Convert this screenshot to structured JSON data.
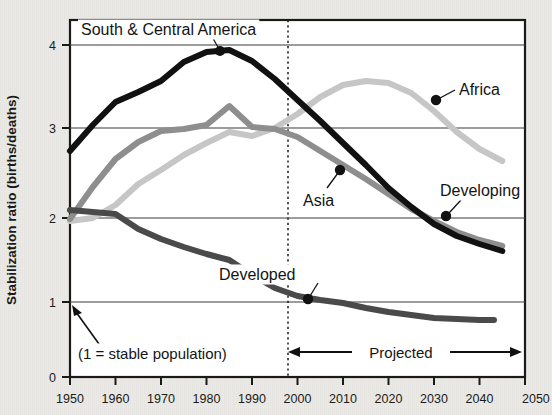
{
  "chart_data": {
    "type": "line",
    "title": "",
    "xlabel": "",
    "ylabel": "Stabilization ratio (births/deaths)",
    "xlim": [
      1950,
      2050
    ],
    "ylim": [
      0,
      4.35
    ],
    "yticks": [
      0,
      1,
      2,
      3,
      4
    ],
    "xticks": [
      1950,
      1960,
      1970,
      1980,
      1990,
      2000,
      2010,
      2020,
      2030,
      2040,
      2050
    ],
    "grid": "horizontal",
    "legend": "inline-annotations",
    "annotations": [
      {
        "text": "South & Central America",
        "x": 1980,
        "y": 3.88
      },
      {
        "text": "Africa",
        "x": 2027,
        "y": 3.38
      },
      {
        "text": "Asia",
        "x": 2007,
        "y": 2.42
      },
      {
        "text": "Developing",
        "x": 2030,
        "y": 2.02
      },
      {
        "text": "Developed",
        "x": 2005,
        "y": 1.07
      },
      {
        "text": "(1 = stable population)",
        "x": 1953,
        "y": 0.55
      },
      {
        "text": "Projected",
        "x": 2018,
        "y": 0.32
      }
    ],
    "projection_divider_x": 1997,
    "series": [
      {
        "name": "South & Central America",
        "color": "#111111",
        "shade": "black",
        "x": [
          1950,
          1955,
          1960,
          1965,
          1970,
          1975,
          1980,
          1985,
          1990,
          1995,
          2000,
          2005,
          2010,
          2015,
          2020,
          2025,
          2030,
          2035,
          2040,
          2045
        ],
        "values": [
          2.72,
          3.03,
          3.3,
          3.42,
          3.55,
          3.78,
          3.9,
          3.93,
          3.8,
          3.58,
          3.33,
          3.08,
          2.82,
          2.55,
          2.28,
          2.05,
          1.85,
          1.7,
          1.6,
          1.52
        ]
      },
      {
        "name": "Asia",
        "color": "#8e8e8e",
        "shade": "medium-gray",
        "x": [
          1950,
          1955,
          1960,
          1965,
          1970,
          1975,
          1980,
          1985,
          1990,
          1995,
          2000,
          2005,
          2010,
          2015,
          2020,
          2025,
          2030,
          2035,
          2040,
          2045
        ],
        "values": [
          1.9,
          2.28,
          2.62,
          2.82,
          2.95,
          2.98,
          3.02,
          3.25,
          3.0,
          2.98,
          2.88,
          2.72,
          2.55,
          2.38,
          2.2,
          2.02,
          1.88,
          1.75,
          1.65,
          1.58
        ]
      },
      {
        "name": "Africa",
        "color": "#c6c6c6",
        "shade": "light-gray",
        "x": [
          1950,
          1955,
          1960,
          1965,
          1970,
          1975,
          1980,
          1985,
          1990,
          1995,
          2000,
          2005,
          2010,
          2015,
          2020,
          2025,
          2030,
          2035,
          2040,
          2045
        ],
        "values": [
          1.88,
          1.95,
          2.08,
          2.3,
          2.5,
          2.68,
          2.82,
          2.95,
          2.9,
          2.98,
          3.15,
          3.35,
          3.5,
          3.55,
          3.52,
          3.4,
          3.2,
          2.95,
          2.75,
          2.6
        ]
      },
      {
        "name": "Developed",
        "color": "#4a4a4a",
        "shade": "dark-gray",
        "x": [
          1950,
          1955,
          1960,
          1965,
          1970,
          1975,
          1980,
          1985,
          1990,
          1995,
          2000,
          2005,
          2010,
          2015,
          2020,
          2025,
          2030,
          2035,
          2040,
          2045
        ],
        "values": [
          2.15,
          2.13,
          2.1,
          1.92,
          1.8,
          1.7,
          1.62,
          1.55,
          1.38,
          1.22,
          1.12,
          1.07,
          1.03,
          0.97,
          0.92,
          0.88,
          0.85,
          0.84,
          0.83,
          0.83
        ]
      },
      {
        "name": "Developing",
        "color": "#8e8e8e",
        "shade": "medium-gray",
        "x": [
          2030
        ],
        "values": [
          2.02
        ]
      }
    ]
  },
  "axis": {
    "y_title": "Stabilization ratio (births/deaths)",
    "y_ticks": [
      "0",
      "1",
      "2",
      "3",
      "4"
    ],
    "x_ticks": [
      "1950",
      "1960",
      "1970",
      "1980",
      "1990",
      "2000",
      "2010",
      "2020",
      "2030",
      "2040",
      "2050"
    ]
  },
  "labels": {
    "south_central_america": "South & Central America",
    "africa": "Africa",
    "asia": "Asia",
    "developing": "Developing",
    "developed": "Developed",
    "stable_note": "(1 = stable population)",
    "projected": "Projected"
  },
  "colors": {
    "black_series": "#111111",
    "dark_gray_series": "#4a4a4a",
    "medium_gray_series": "#8e8e8e",
    "light_gray_series": "#c6c6c6",
    "axis": "#1a1a1a",
    "grid": "#3a3a3a",
    "paper": "#eceae6"
  }
}
